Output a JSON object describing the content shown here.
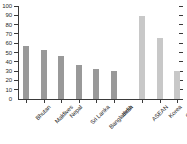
{
  "chart_data": {
    "type": "bar",
    "title": "",
    "subtitle": "",
    "xlabel": "",
    "ylabel": "",
    "ylim": [
      0,
      100
    ],
    "ytick_step": 10,
    "grid": false,
    "legend": "none",
    "axis_ticks_both_sides": true,
    "categories": [
      "Bhutan",
      "Maldives",
      "Nepal",
      "Sri Lanka",
      "Bangladesh",
      "India",
      "ASEAN",
      "Korea",
      "China",
      "Japan"
    ],
    "values": [
      57,
      53,
      46,
      37,
      32,
      30,
      89,
      66,
      30,
      27
    ],
    "ytick_labels": [
      "0",
      "10",
      "20",
      "30",
      "40",
      "50",
      "60",
      "70",
      "80",
      "90",
      "100"
    ],
    "groups": [
      {
        "name": "South Asia",
        "color": "#999999",
        "categories": [
          "Bhutan",
          "Maldives",
          "Nepal",
          "Sri Lanka",
          "Bangladesh",
          "India"
        ],
        "values": [
          57,
          53,
          46,
          37,
          32,
          30
        ]
      },
      {
        "name": "East and Southeast Asia",
        "color": "#c8c8c8",
        "categories": [
          "ASEAN",
          "Korea",
          "China",
          "Japan"
        ],
        "values": [
          89,
          66,
          30,
          27
        ]
      }
    ],
    "colors": {
      "group_one_bar": "#999999",
      "group_two_bar": "#c8c8c8",
      "axis": "#3a3a3a",
      "text": "#2b2b2b",
      "background": "#ffffff"
    }
  }
}
